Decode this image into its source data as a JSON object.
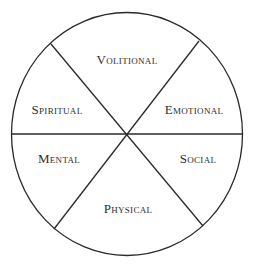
{
  "diagram": {
    "type": "wheel",
    "segments": [
      {
        "id": "volitional",
        "label": "Volitional",
        "position": "top"
      },
      {
        "id": "emotional",
        "label": "Emotional",
        "position": "upper-right"
      },
      {
        "id": "social",
        "label": "Social",
        "position": "lower-right"
      },
      {
        "id": "physical",
        "label": "Physical",
        "position": "bottom"
      },
      {
        "id": "mental",
        "label": "Mental",
        "position": "lower-left"
      },
      {
        "id": "spiritual",
        "label": "Spiritual",
        "position": "upper-left"
      }
    ],
    "colors": {
      "stroke": "#2a2a2a",
      "text": "#2e2e2e",
      "background": "#ffffff"
    }
  }
}
